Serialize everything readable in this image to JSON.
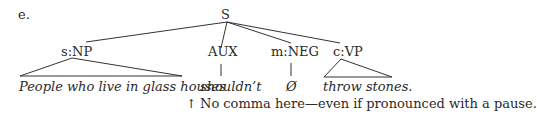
{
  "example_label": "e.",
  "tree": {
    "root": "S",
    "nodes": [
      {
        "label": "s:NP",
        "text": "People who live in glass houses",
        "type": "triangle"
      },
      {
        "label": "AUX",
        "text": "shouldn’t",
        "type": "line"
      },
      {
        "label": "m:NEG",
        "text": "Ø",
        "type": "line"
      },
      {
        "label": "c:VP",
        "text": "throw stones.",
        "type": "triangle"
      }
    ]
  },
  "note": {
    "arrow": "↑",
    "text": "No comma here—even if pronounced with a pause."
  }
}
